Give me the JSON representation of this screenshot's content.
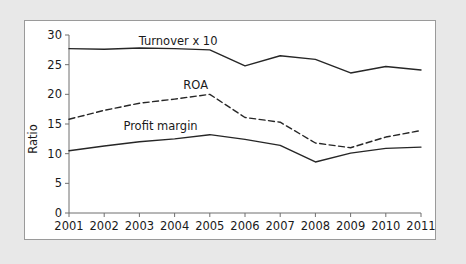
{
  "chart_data": {
    "type": "line",
    "title": "",
    "xlabel": "",
    "ylabel": "Ratio",
    "x": [
      2001,
      2002,
      2003,
      2004,
      2005,
      2006,
      2007,
      2008,
      2009,
      2010,
      2011
    ],
    "categories": [
      "2001",
      "2002",
      "2003",
      "2004",
      "2005",
      "2006",
      "2007",
      "2008",
      "2009",
      "2010",
      "2011"
    ],
    "xlim": [
      2001,
      2011
    ],
    "ylim": [
      0,
      30
    ],
    "yticks": [
      0,
      5,
      10,
      15,
      20,
      25,
      30
    ],
    "ytick_labels": [
      "0",
      "5",
      "10",
      "15",
      "20",
      "25",
      "30"
    ],
    "xticks": [
      2001,
      2002,
      2003,
      2004,
      2005,
      2006,
      2007,
      2008,
      2009,
      2010,
      2011
    ],
    "grid": false,
    "legend_position": "inline-labels",
    "series": [
      {
        "name": "Turnover x 10",
        "style": "solid",
        "color": "#262626",
        "label_x": 2004.1,
        "label_y": 29.0,
        "values": [
          27.7,
          27.6,
          27.8,
          27.7,
          27.5,
          24.8,
          26.5,
          25.9,
          23.6,
          24.7,
          24.1
        ]
      },
      {
        "name": "ROA",
        "style": "dashed",
        "color": "#262626",
        "label_x": 2004.6,
        "label_y": 21.6,
        "values": [
          15.8,
          17.3,
          18.5,
          19.2,
          20.0,
          16.1,
          15.3,
          11.8,
          11.0,
          12.8,
          13.9
        ]
      },
      {
        "name": "Profit margin",
        "style": "solid",
        "color": "#262626",
        "label_x": 2003.6,
        "label_y": 14.6,
        "values": [
          10.5,
          11.3,
          12.0,
          12.5,
          13.2,
          12.4,
          11.4,
          8.6,
          10.1,
          10.9,
          11.1
        ]
      }
    ]
  },
  "axis": {
    "y_title": "Ratio"
  }
}
